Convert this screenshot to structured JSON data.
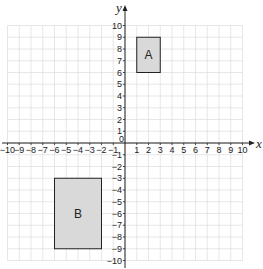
{
  "diagram": {
    "type": "coordinate-grid",
    "x_axis": {
      "label": "x",
      "min": -10,
      "max": 10,
      "ticks": [
        "-10",
        "-9",
        "-8",
        "-7",
        "-6",
        "-5",
        "-4",
        "-3",
        "-2",
        "-1",
        "1",
        "2",
        "3",
        "4",
        "5",
        "6",
        "7",
        "8",
        "9",
        "10"
      ]
    },
    "y_axis": {
      "label": "y",
      "min": -10,
      "max": 10,
      "ticks": [
        "10",
        "9",
        "8",
        "7",
        "6",
        "5",
        "4",
        "3",
        "2",
        "1",
        "-1",
        "-2",
        "-3",
        "-4",
        "-5",
        "-6",
        "-7",
        "-8",
        "-9",
        "-10"
      ]
    },
    "origin_label": "0",
    "shapes": [
      {
        "label": "A",
        "x1": 1,
        "y1": 6,
        "x2": 3,
        "y2": 9,
        "fill": "#d9d9d9"
      },
      {
        "label": "B",
        "x1": -6,
        "y1": -9,
        "x2": -2,
        "y2": -3,
        "fill": "#d9d9d9"
      }
    ],
    "colors": {
      "grid": "#dddddd",
      "axis": "#222222",
      "shape_stroke": "#222222"
    }
  }
}
